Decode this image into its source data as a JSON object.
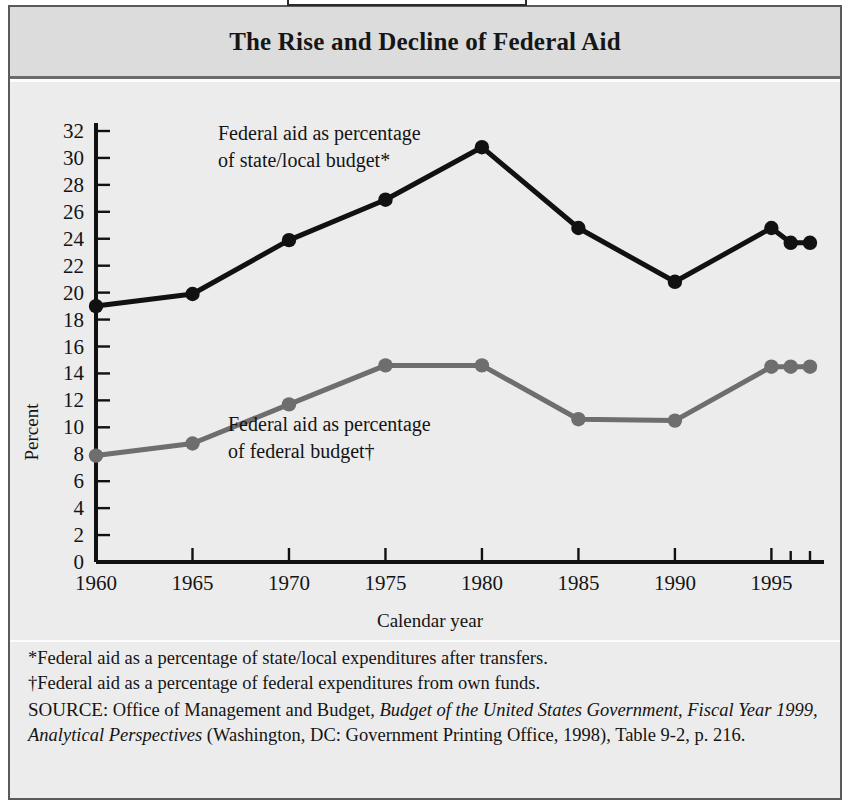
{
  "figure": {
    "tab_label": "FIGURE 3.2",
    "title": "The Rise and Decline of Federal Aid"
  },
  "chart_data": {
    "type": "line",
    "title": "The Rise and Decline of Federal Aid",
    "xlabel": "Calendar year",
    "ylabel": "Percent",
    "x": [
      1960,
      1965,
      1970,
      1975,
      1980,
      1985,
      1990,
      1995,
      1996,
      1997
    ],
    "xtick_labels": [
      "1960",
      "1965",
      "1970",
      "1975",
      "1980",
      "1985",
      "1990",
      "1995"
    ],
    "xtick_values": [
      1960,
      1965,
      1970,
      1975,
      1980,
      1985,
      1990,
      1995
    ],
    "extra_ticks": [
      1996,
      1997
    ],
    "xlim": [
      1960,
      1997
    ],
    "ylim": [
      0,
      32
    ],
    "ytick_values": [
      0,
      2,
      4,
      6,
      8,
      10,
      12,
      14,
      16,
      18,
      20,
      22,
      24,
      26,
      28,
      30,
      32
    ],
    "ytick_labels": [
      "0",
      "2",
      "4",
      "6",
      "8",
      "10",
      "12",
      "14",
      "16",
      "18",
      "20",
      "22",
      "24",
      "26",
      "28",
      "30",
      "32"
    ],
    "grid": false,
    "legend": "inline-annotations",
    "series": [
      {
        "name": "Federal aid as percentage of state/local budget*",
        "color": "#111111",
        "values": [
          19.0,
          19.9,
          23.9,
          26.9,
          30.8,
          24.8,
          20.8,
          24.8,
          23.7,
          23.7
        ]
      },
      {
        "name": "Federal aid as percentage of federal budget†",
        "color": "#6e6e6e",
        "values": [
          7.9,
          8.8,
          11.7,
          14.6,
          14.6,
          10.6,
          10.5,
          14.5,
          14.5,
          14.5
        ]
      }
    ],
    "annotations": [
      {
        "id": "annotation-state-local",
        "line1": "Federal aid as percentage",
        "line2": "of state/local budget*"
      },
      {
        "id": "annotation-federal",
        "line1": "Federal aid as percentage",
        "line2": "of federal budget†"
      }
    ]
  },
  "notes": {
    "footnote_star": "*Federal aid as a percentage of state/local expenditures after transfers.",
    "footnote_dagger": "†Federal aid as a percentage of federal expenditures from own funds.",
    "source_label": "SOURCE",
    "source_text_1": ": Office of Management and Budget, ",
    "source_italic_1": "Budget of the United States Government, Fiscal Year 1999, Analytical Perspectives",
    "source_text_2": " (Washington, DC: Government Printing Office, 1998), Table 9-2, p. 216."
  },
  "colors": {
    "series_black": "#111111",
    "series_gray": "#6e6e6e",
    "panel_bg": "#ececec",
    "title_bg": "#dcdcdc",
    "frame": "#5a5a5a"
  }
}
